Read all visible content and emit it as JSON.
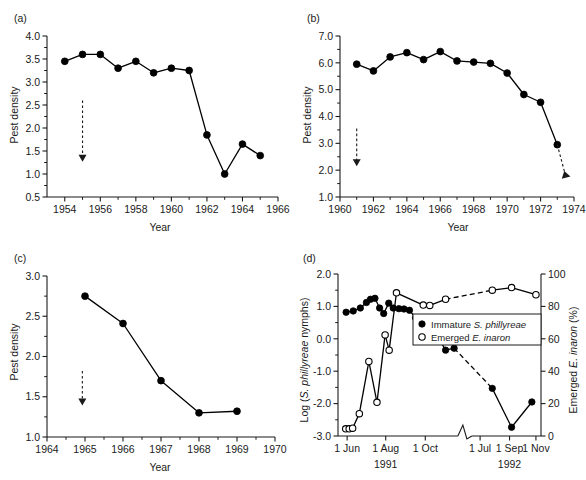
{
  "figure": {
    "panels": [
      "a",
      "b",
      "c",
      "d"
    ]
  },
  "panel_a": {
    "letter": "(a)",
    "chart_data": {
      "type": "line",
      "title": "",
      "xlabel": "Year",
      "ylabel": "Pest density",
      "xlim": [
        1953,
        1966
      ],
      "ylim": [
        0.5,
        4.0
      ],
      "xticks": [
        1954,
        1956,
        1958,
        1960,
        1962,
        1964,
        1966
      ],
      "xtick_labels": [
        "1954",
        "1956",
        "1958",
        "1960",
        "1962",
        "1964",
        "1966"
      ],
      "yticks": [
        0.5,
        1.0,
        1.5,
        2.0,
        2.5,
        3.0,
        3.5,
        4.0
      ],
      "ytick_labels": [
        "0.5",
        "1.0",
        "1.5",
        "2.0",
        "2.5",
        "3.0",
        "3.5",
        "4.0"
      ],
      "grid": false,
      "marker": "filled-circle",
      "x": [
        1954,
        1955,
        1956,
        1957,
        1958,
        1959,
        1960,
        1961,
        1962,
        1963,
        1964,
        1965
      ],
      "values": [
        3.45,
        3.6,
        3.6,
        3.3,
        3.45,
        3.2,
        3.3,
        3.25,
        1.85,
        1.0,
        1.65,
        1.4
      ],
      "annotation": {
        "type": "release-arrow",
        "x": 1955,
        "y_top": 2.6,
        "y_tip": 1.3
      }
    }
  },
  "panel_b": {
    "letter": "(b)",
    "chart_data": {
      "type": "line",
      "title": "",
      "xlabel": "Year",
      "ylabel": "Pest density",
      "xlim": [
        1960,
        1974
      ],
      "ylim": [
        1.0,
        7.0
      ],
      "xticks": [
        1960,
        1962,
        1964,
        1966,
        1968,
        1970,
        1972,
        1974
      ],
      "xtick_labels": [
        "1960",
        "1962",
        "1964",
        "1966",
        "1968",
        "1970",
        "1972",
        "1974"
      ],
      "yticks": [
        1.0,
        2.0,
        3.0,
        4.0,
        5.0,
        6.0,
        7.0
      ],
      "ytick_labels": [
        "1.0",
        "2.0",
        "3.0",
        "4.0",
        "5.0",
        "6.0",
        "7.0"
      ],
      "grid": false,
      "marker": "filled-circle",
      "x": [
        1961,
        1962,
        1963,
        1964,
        1965,
        1966,
        1967,
        1968,
        1969,
        1970,
        1971,
        1972,
        1973
      ],
      "values": [
        5.95,
        5.7,
        6.22,
        6.38,
        6.12,
        6.42,
        6.07,
        6.03,
        5.98,
        5.62,
        4.82,
        4.53,
        2.95
      ],
      "annotations": [
        {
          "type": "release-arrow",
          "x": 1961,
          "y_top": 3.55,
          "y_tip": 2.2
        },
        {
          "type": "drop-arrow",
          "x_from": 1973,
          "y_from": 2.95,
          "x_to": 1973.45,
          "y_to": 1.9
        }
      ]
    }
  },
  "panel_c": {
    "letter": "(c)",
    "chart_data": {
      "type": "line",
      "title": "",
      "xlabel": "Year",
      "ylabel": "Pest density",
      "xlim": [
        1964,
        1970
      ],
      "ylim": [
        1.0,
        3.0
      ],
      "xticks": [
        1964,
        1965,
        1966,
        1967,
        1968,
        1969,
        1970
      ],
      "xtick_labels": [
        "1964",
        "1965",
        "1966",
        "1967",
        "1968",
        "1969",
        "1970"
      ],
      "yticks": [
        1.0,
        1.5,
        2.0,
        2.5,
        3.0
      ],
      "ytick_labels": [
        "1.0",
        "1.5",
        "2.0",
        "2.5",
        "3.0"
      ],
      "grid": false,
      "marker": "filled-circle",
      "x": [
        1965,
        1966,
        1967,
        1968,
        1969
      ],
      "values": [
        2.75,
        2.41,
        1.7,
        1.3,
        1.32
      ],
      "annotation": {
        "type": "release-arrow",
        "x": 1964.93,
        "y_top": 1.82,
        "y_tip": 1.41
      }
    }
  },
  "panel_d": {
    "letter": "(d)",
    "legend": {
      "items": [
        {
          "marker": "filled-circle",
          "prefix": "Immature ",
          "species": "S. phillyreae",
          "suffix": ""
        },
        {
          "marker": "open-circle",
          "prefix": "Emerged ",
          "species": "E. inaron",
          "suffix": ""
        }
      ]
    },
    "chart_data": {
      "type": "line",
      "title": "",
      "xlabel": "",
      "ylabel": "Log (S. phillyreae nymphs)",
      "ylabel2": "Emerged E. inaron (%)",
      "ylim": [
        -3.0,
        2.0
      ],
      "yticks": [
        -3.0,
        -2.0,
        -1.0,
        0.0,
        1.0,
        2.0
      ],
      "ytick_labels": [
        "-3.0",
        "-2.0",
        "-1.0",
        "0.0",
        "1.0",
        "2.0"
      ],
      "ylim2": [
        0,
        100
      ],
      "yticks2": [
        0,
        20,
        40,
        60,
        80,
        100
      ],
      "ytick_labels2": [
        "0",
        "20",
        "40",
        "60",
        "80",
        "100"
      ],
      "grid": false,
      "axis_break": true,
      "xtick_labels": [
        "1 Jun",
        "1 Aug",
        "1 Oct",
        "1 Jul",
        "1 Sep",
        "1 Nov"
      ],
      "year_labels": [
        "1991",
        "1992"
      ],
      "series": [
        {
          "name": "Immature S. phillyreae",
          "marker": "filled-circle",
          "axis": "left",
          "points": [
            {
              "t": 0.04,
              "v": 0.82
            },
            {
              "t": 0.075,
              "v": 0.86
            },
            {
              "t": 0.11,
              "v": 0.95
            },
            {
              "t": 0.14,
              "v": 1.12
            },
            {
              "t": 0.16,
              "v": 1.22
            },
            {
              "t": 0.182,
              "v": 1.25
            },
            {
              "t": 0.205,
              "v": 0.95
            },
            {
              "t": 0.225,
              "v": 0.78
            },
            {
              "t": 0.25,
              "v": 1.1
            },
            {
              "t": 0.272,
              "v": 0.95
            },
            {
              "t": 0.3,
              "v": 0.93
            },
            {
              "t": 0.325,
              "v": 0.92
            },
            {
              "t": 0.352,
              "v": 0.88
            },
            {
              "t": 0.382,
              "v": 0.65
            },
            {
              "t": 0.42,
              "v": 0.27
            },
            {
              "t": 0.452,
              "v": 0.22
            },
            {
              "t": 0.48,
              "v": 0.19
            },
            {
              "t": 0.53,
              "v": -0.35
            },
            {
              "t": 0.572,
              "v": -0.29
            },
            {
              "t": 0.76,
              "v": -1.53
            },
            {
              "t": 0.855,
              "v": -2.73
            },
            {
              "t": 0.955,
              "v": -1.95
            }
          ],
          "dashed_gap": [
            [
              0.572,
              0.76
            ]
          ]
        },
        {
          "name": "Emerged E. inaron",
          "marker": "open-circle",
          "axis": "right",
          "points": [
            {
              "t": 0.038,
              "v": -2.78
            },
            {
              "t": 0.055,
              "v": -2.78
            },
            {
              "t": 0.072,
              "v": -2.76
            },
            {
              "t": 0.105,
              "v": -2.31
            },
            {
              "t": 0.152,
              "v": -0.7
            },
            {
              "t": 0.192,
              "v": -1.96
            },
            {
              "t": 0.232,
              "v": 0.12
            },
            {
              "t": 0.252,
              "v": -0.35
            },
            {
              "t": 0.288,
              "v": 1.42
            },
            {
              "t": 0.42,
              "v": 1.04
            },
            {
              "t": 0.452,
              "v": 1.03
            },
            {
              "t": 0.53,
              "v": 1.22
            },
            {
              "t": 0.76,
              "v": 1.5
            },
            {
              "t": 0.855,
              "v": 1.58
            },
            {
              "t": 0.975,
              "v": 1.36
            }
          ],
          "dashed_gap": [
            [
              0.53,
              0.76
            ]
          ]
        }
      ]
    }
  }
}
